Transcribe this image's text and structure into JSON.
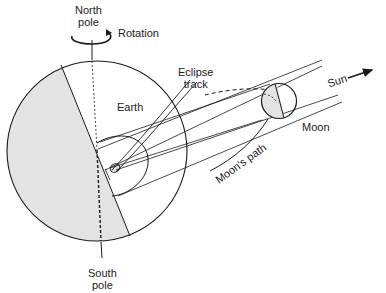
{
  "diagram": {
    "labels": {
      "north_pole_line1": "North",
      "north_pole_line2": "pole",
      "rotation": "Rotation",
      "earth": "Earth",
      "eclipse_track_line1": "Eclipse",
      "eclipse_track_line2": "track",
      "sun": "Sun",
      "moon": "Moon",
      "moons_path": "Moon's path",
      "south_pole_line1": "South",
      "south_pole_line2": "pole"
    },
    "colors": {
      "stroke": "#1a1a1a",
      "shade": "#e3e3e3",
      "background": "#ffffff"
    }
  }
}
